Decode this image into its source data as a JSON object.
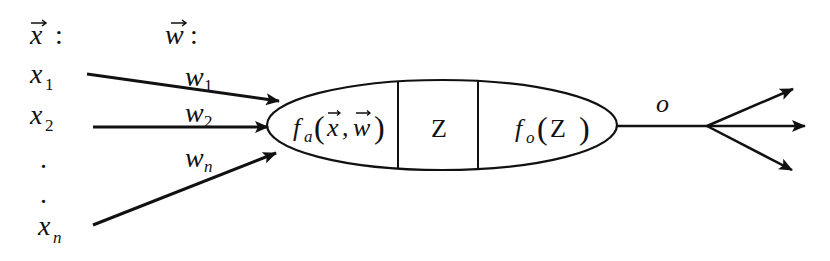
{
  "diagram": {
    "type": "artificial-neuron",
    "colors": {
      "ink": "#111111",
      "background": "#ffffff"
    },
    "header": {
      "inputs_vector": {
        "symbol": "x",
        "vector_arrow": "⃗",
        "suffix": ":"
      },
      "weights_vector": {
        "symbol": "w",
        "vector_arrow": "⃗",
        "suffix": ":"
      }
    },
    "inputs": [
      {
        "symbol": "x",
        "subscript": "1"
      },
      {
        "symbol": "x",
        "subscript": "2"
      },
      {
        "symbol": ".",
        "subscript": ""
      },
      {
        "symbol": ".",
        "subscript": ""
      },
      {
        "symbol": "x",
        "subscript": "n"
      }
    ],
    "weights": [
      {
        "symbol": "w",
        "subscript": "1"
      },
      {
        "symbol": "w",
        "subscript": "2"
      },
      {
        "symbol": "w",
        "subscript": "n"
      }
    ],
    "neuron": {
      "activation": {
        "func": "f",
        "sub": "a",
        "open": "(",
        "arg1": "x",
        "comma": ",",
        "arg2": "w",
        "close": ")"
      },
      "state": {
        "label": "Z"
      },
      "output_func": {
        "func": "f",
        "sub": "o",
        "open": "(",
        "arg": "Z",
        "close": ")"
      }
    },
    "output": {
      "label": "o",
      "branches": 3
    }
  }
}
